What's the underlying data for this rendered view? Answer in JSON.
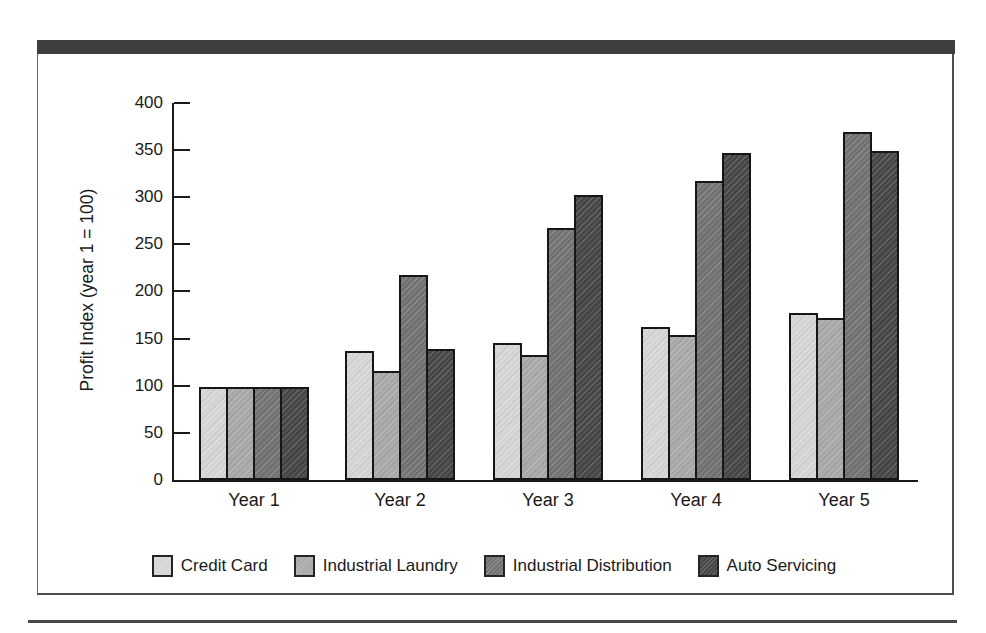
{
  "decor": {
    "top_bar_color": "#3e3e3e",
    "frame_border_color": "#4d4d4d",
    "bottom_rule_color": "#4a4a4a",
    "axis_color": "#1a1a1a",
    "bar_outline_color": "#161616",
    "background_color": "#ffffff"
  },
  "chart_data": {
    "type": "bar",
    "title": "",
    "xlabel": "",
    "ylabel": "Profit Index (year 1 = 100)",
    "ylim": [
      0,
      400
    ],
    "ytick_step": 50,
    "grid": false,
    "legend_position": "bottom",
    "categories": [
      "Year 1",
      "Year 2",
      "Year 3",
      "Year 4",
      "Year 5"
    ],
    "series": [
      {
        "name": "Credit Card",
        "color": "#d6d6d6",
        "values": [
          97,
          135,
          143,
          160,
          175
        ]
      },
      {
        "name": "Industrial Laundry",
        "color": "#a9a9a9",
        "values": [
          97,
          113,
          130,
          152,
          170
        ]
      },
      {
        "name": "Industrial Distribution",
        "color": "#737373",
        "values": [
          97,
          215,
          265,
          315,
          367
        ]
      },
      {
        "name": "Auto Servicing",
        "color": "#474747",
        "values": [
          97,
          137,
          300,
          345,
          347
        ]
      }
    ],
    "ytick_labels": [
      "0",
      "50",
      "100",
      "150",
      "200",
      "250",
      "300",
      "350",
      "400"
    ]
  }
}
